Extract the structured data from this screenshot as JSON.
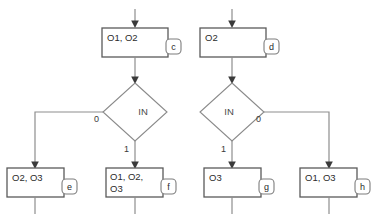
{
  "diagram": {
    "type": "flowchart",
    "title_fragment": "cut-off-heading",
    "nodes": [
      {
        "id": "c",
        "kind": "process",
        "badge": "c",
        "text": "O1, O2",
        "lines": [
          "O1, O2"
        ]
      },
      {
        "id": "d",
        "kind": "process",
        "badge": "d",
        "text": "O2",
        "lines": [
          "O2"
        ]
      },
      {
        "id": "e",
        "kind": "process",
        "badge": "e",
        "text": "O2, O3",
        "lines": [
          "O2, O3"
        ]
      },
      {
        "id": "f",
        "kind": "process",
        "badge": "f",
        "text": "O1, O2, O3",
        "lines": [
          "O1, O2,",
          "O3"
        ]
      },
      {
        "id": "g",
        "kind": "process",
        "badge": "g",
        "text": "O3",
        "lines": [
          "O3"
        ]
      },
      {
        "id": "h",
        "kind": "process",
        "badge": "h",
        "text": "O1, O3",
        "lines": [
          "O1, O3"
        ]
      }
    ],
    "decisions": [
      {
        "id": "dec-left",
        "label": "IN",
        "branches": [
          {
            "value": "0",
            "side": "left",
            "target": "e"
          },
          {
            "value": "1",
            "side": "bottom",
            "target": "f"
          }
        ]
      },
      {
        "id": "dec-right",
        "label": "IN",
        "branches": [
          {
            "value": "0",
            "side": "right",
            "target": "h"
          },
          {
            "value": "1",
            "side": "bottom",
            "target": "g"
          }
        ]
      }
    ],
    "edges": [
      {
        "from": "entry-left",
        "to": "c",
        "label": ""
      },
      {
        "from": "entry-right",
        "to": "d",
        "label": ""
      },
      {
        "from": "c",
        "to": "dec-left",
        "label": ""
      },
      {
        "from": "d",
        "to": "dec-right",
        "label": ""
      },
      {
        "from": "dec-left",
        "to": "e",
        "label": "0"
      },
      {
        "from": "dec-left",
        "to": "f",
        "label": "1"
      },
      {
        "from": "dec-right",
        "to": "g",
        "label": "1"
      },
      {
        "from": "dec-right",
        "to": "h",
        "label": "0"
      }
    ],
    "colors": {
      "node_stroke": "#5a5a5a",
      "edge_stroke": "#8e8e8e",
      "diamond_stroke": "#8a8a8a",
      "text": "#2b2b2b",
      "background": "#ffffff"
    }
  },
  "labels": {
    "decision_left": "IN",
    "decision_right": "IN",
    "left_zero": "0",
    "left_one": "1",
    "right_zero": "0",
    "right_one": "1",
    "badge_c": "c",
    "badge_d": "d",
    "badge_e": "e",
    "badge_f": "f",
    "badge_g": "g",
    "badge_h": "h",
    "node_c": "O1, O2",
    "node_d": "O2",
    "node_e": "O2, O3",
    "node_f_line1": "O1, O2,",
    "node_f_line2": "O3",
    "node_g": "O3",
    "node_h": "O1, O3",
    "cutoff_heading": "·· ···· ··"
  }
}
